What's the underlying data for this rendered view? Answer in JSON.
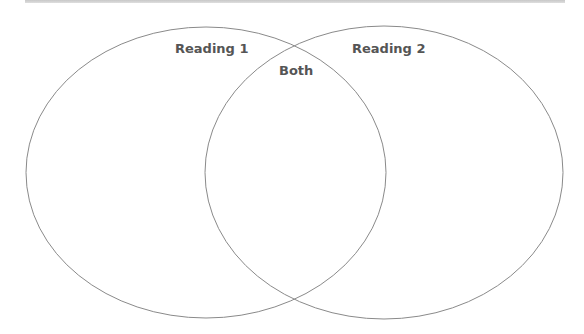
{
  "diagram": {
    "type": "venn",
    "colors": {
      "outline": "#8a8a8a",
      "label": "#555555",
      "top_rule": "#cccccc"
    },
    "sets": [
      {
        "id": "reading-1",
        "label": "Reading 1",
        "cx": 206,
        "cy": 172,
        "rx": 180,
        "ry": 145
      },
      {
        "id": "reading-2",
        "label": "Reading 2",
        "cx": 384,
        "cy": 172,
        "rx": 179,
        "ry": 146
      }
    ],
    "overlap": {
      "label": "Both"
    }
  }
}
